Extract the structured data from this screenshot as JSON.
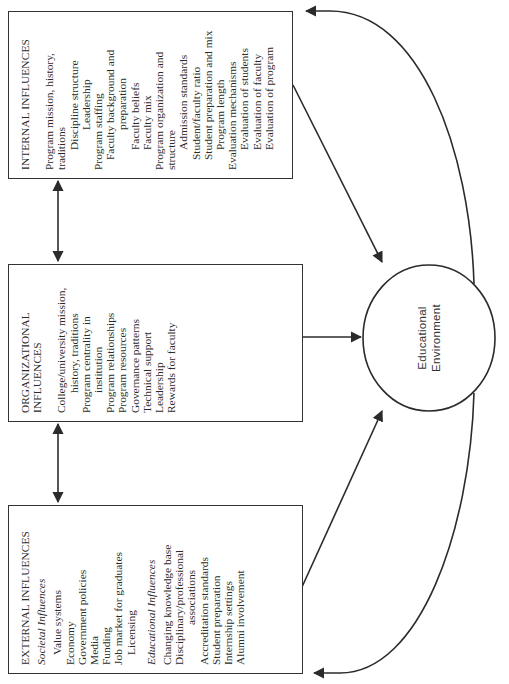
{
  "diagram": {
    "internal": {
      "title": "INTERNAL INFLUENCES",
      "items": [
        {
          "text": "Program mission, history,",
          "indent": 0
        },
        {
          "text": "traditions",
          "indent": 0
        },
        {
          "text": "Discipline structure",
          "indent": 2
        },
        {
          "text": "Leadership",
          "indent": 3
        },
        {
          "text": "Program staffing",
          "indent": 0
        },
        {
          "text": "Faculty background and",
          "indent": 1
        },
        {
          "text": "preparation",
          "indent": 3
        },
        {
          "text": "Faculty beliefs",
          "indent": 2
        },
        {
          "text": "Faculty mix",
          "indent": 2
        },
        {
          "text": "Program organization and",
          "indent": 0
        },
        {
          "text": "structure",
          "indent": 0
        },
        {
          "text": "Admission standards",
          "indent": 2
        },
        {
          "text": "Student/faculty ratio",
          "indent": 1
        },
        {
          "text": "Student preparation and mix",
          "indent": 1
        },
        {
          "text": "Program length",
          "indent": 2
        },
        {
          "text": "Evaluation mechanisms",
          "indent": 0
        },
        {
          "text": "Evaluation of students",
          "indent": 2
        },
        {
          "text": "Evaluation of faculty",
          "indent": 2
        },
        {
          "text": "Evaluation of program",
          "indent": 2
        }
      ]
    },
    "organizational": {
      "title_line1": "ORGANIZATIONAL",
      "title_line2": "INFLUENCES",
      "items": [
        {
          "text": "College/university mission,",
          "indent": 0
        },
        {
          "text": "history, traditions",
          "indent": 2
        },
        {
          "text": "Program centrality in",
          "indent": 0
        },
        {
          "text": "institution",
          "indent": 2
        },
        {
          "text": "Program relationships",
          "indent": 0
        },
        {
          "text": "Program resources",
          "indent": 0
        },
        {
          "text": "Governance patterns",
          "indent": 0
        },
        {
          "text": "Technical support",
          "indent": 0
        },
        {
          "text": "Leadership",
          "indent": 0
        },
        {
          "text": "Rewards for faculty",
          "indent": 0
        }
      ]
    },
    "external": {
      "title": "EXTERNAL INFLUENCES",
      "societal_heading": "Societal Influences",
      "societal_items": [
        {
          "text": "Value systems",
          "indent": 1
        },
        {
          "text": "Economy",
          "indent": 0
        },
        {
          "text": "Government policies",
          "indent": 0
        },
        {
          "text": "Media",
          "indent": 0
        },
        {
          "text": "Funding",
          "indent": 0
        },
        {
          "text": "Job market for graduates",
          "indent": 0
        },
        {
          "text": "Licensing",
          "indent": 1
        }
      ],
      "educational_heading": "Educational Influences",
      "educational_items": [
        {
          "text": "Changing knowledge base",
          "indent": 0
        },
        {
          "text": "Disciplinary/professional",
          "indent": 0
        },
        {
          "text": "associations",
          "indent": 3
        },
        {
          "text": "Accreditation standards",
          "indent": 0
        },
        {
          "text": "Student preparation",
          "indent": 0
        },
        {
          "text": "Internship settings",
          "indent": 0
        },
        {
          "text": "Alumni involvement",
          "indent": 0
        }
      ]
    },
    "center": {
      "line1": "Educational",
      "line2": "Environment"
    },
    "colors": {
      "line": "#2b2b2b",
      "background": "#ffffff"
    }
  }
}
